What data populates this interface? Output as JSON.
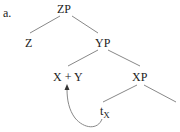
{
  "example_label": "a.",
  "tree": {
    "root": "ZP",
    "nodes": {
      "z": "Z",
      "yp": "YP",
      "xy": "X + Y",
      "xp": "XP",
      "trace": "t",
      "trace_sub": "X"
    },
    "edges": [
      [
        "ZP",
        "Z"
      ],
      [
        "ZP",
        "YP"
      ],
      [
        "YP",
        "X + Y"
      ],
      [
        "YP",
        "XP"
      ],
      [
        "XP",
        "tX"
      ],
      [
        "XP",
        "(unlabeled)"
      ]
    ],
    "movement_arrow": {
      "from": "tX",
      "to": "X + Y"
    }
  },
  "colors": {
    "line": "#777777",
    "text": "#222222"
  }
}
